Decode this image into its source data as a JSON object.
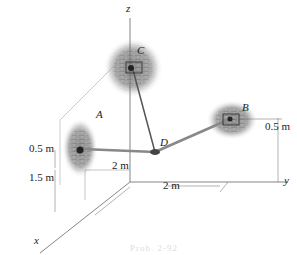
{
  "figure": {
    "axes": {
      "x": "x",
      "y": "y",
      "z": "z"
    },
    "points": {
      "A": "A",
      "B": "B",
      "C": "C",
      "D": "D"
    },
    "dimensions": {
      "a_height_upper": "0.5 m",
      "a_height_lower": "1.5 m",
      "b_height": "0.5 m",
      "x_offset": "2 m",
      "y_offset": "2 m"
    },
    "caption": "Prob. 2-92"
  }
}
